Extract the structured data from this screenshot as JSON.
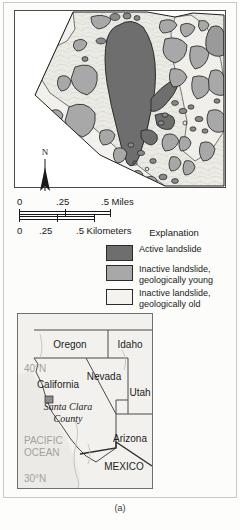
{
  "figure": {
    "caption": "(a)"
  },
  "map": {
    "title": "Santa Clara County landslide map",
    "colors": {
      "active_landslide": "#6e6e6e",
      "inactive_young": "#a8a8a8",
      "inactive_old": "#f0efeb",
      "terrain_base": "#e9e7e1",
      "outline": "#1f1f1f"
    }
  },
  "north_arrow": {
    "label": "N"
  },
  "scalebars": [
    {
      "name": "miles",
      "unit_label": ".5 Miles",
      "ticks": [
        "0",
        ".25",
        ".5"
      ]
    },
    {
      "name": "kilometers",
      "unit_label": ".5 Kilometers",
      "ticks": [
        "0",
        ".25",
        ".5"
      ]
    }
  ],
  "explanation": {
    "title": "Explanation",
    "items": [
      {
        "label": "Active landslide",
        "color": "#6e6e6e"
      },
      {
        "label": "Inactive landslide, geologically young",
        "color": "#a8a8a8"
      },
      {
        "label": "Inactive landslide, geologically old",
        "color": "#f4f3ef"
      }
    ]
  },
  "inset": {
    "states": [
      {
        "name": "Oregon"
      },
      {
        "name": "Idaho"
      },
      {
        "name": "Nevada"
      },
      {
        "name": "Utah"
      },
      {
        "name": "California"
      },
      {
        "name": "Arizona"
      }
    ],
    "places": [
      {
        "name": "Santa Clara County"
      },
      {
        "name": "MEXICO"
      }
    ],
    "water": [
      {
        "name": "PACIFIC OCEAN"
      }
    ],
    "latitudes": [
      {
        "name": "40°N"
      },
      {
        "name": "30°N"
      }
    ]
  }
}
